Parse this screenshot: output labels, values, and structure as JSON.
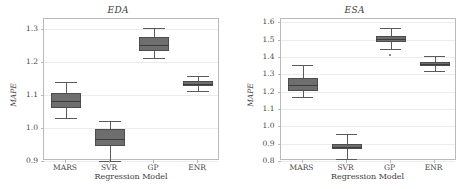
{
  "chart_data": [
    {
      "type": "box",
      "title": "EDA",
      "xlabel": "Regression Model",
      "ylabel": "MAPE",
      "categories": [
        "MARS",
        "SVR",
        "GP",
        "ENR"
      ],
      "ylim": [
        0.9,
        1.33
      ],
      "yticks": [
        0.9,
        1.0,
        1.1,
        1.2,
        1.3
      ],
      "ytick_labels": [
        "0.9",
        "1.0",
        "1.1",
        "1.2",
        "1.3"
      ],
      "grid": true,
      "legend": "none",
      "boxes": [
        {
          "name": "MARS",
          "whisker_low": 1.03,
          "q1": 1.06,
          "median": 1.082,
          "q3": 1.107,
          "whisker_high": 1.14,
          "fliers": []
        },
        {
          "name": "SVR",
          "whisker_low": 0.9,
          "q1": 0.945,
          "median": 0.968,
          "q3": 0.998,
          "whisker_high": 1.022,
          "fliers": []
        },
        {
          "name": "GP",
          "whisker_low": 1.212,
          "q1": 1.234,
          "median": 1.252,
          "q3": 1.276,
          "whisker_high": 1.303,
          "fliers": []
        },
        {
          "name": "ENR",
          "whisker_low": 1.112,
          "q1": 1.128,
          "median": 1.134,
          "q3": 1.141,
          "whisker_high": 1.156,
          "fliers": []
        }
      ]
    },
    {
      "type": "box",
      "title": "ESA",
      "xlabel": "Regression Model",
      "ylabel": "MAPE",
      "categories": [
        "MARS",
        "SVR",
        "GP",
        "ENR"
      ],
      "ylim": [
        0.8,
        1.62
      ],
      "yticks": [
        0.8,
        0.9,
        1.0,
        1.1,
        1.2,
        1.3,
        1.4,
        1.5,
        1.6
      ],
      "ytick_labels": [
        "0.8",
        "0.9",
        "1.0",
        "1.1",
        "1.2",
        "1.3",
        "1.4",
        "1.5",
        "1.6"
      ],
      "grid": true,
      "legend": "none",
      "boxes": [
        {
          "name": "MARS",
          "whisker_low": 1.168,
          "q1": 1.205,
          "median": 1.238,
          "q3": 1.278,
          "whisker_high": 1.352,
          "fliers": []
        },
        {
          "name": "SVR",
          "whisker_low": 0.81,
          "q1": 0.868,
          "median": 0.883,
          "q3": 0.898,
          "whisker_high": 0.958,
          "fliers": []
        },
        {
          "name": "GP",
          "whisker_low": 1.448,
          "q1": 1.487,
          "median": 1.503,
          "q3": 1.519,
          "whisker_high": 1.57,
          "fliers": [
            1.41
          ]
        },
        {
          "name": "ENR",
          "whisker_low": 1.322,
          "q1": 1.347,
          "median": 1.36,
          "q3": 1.373,
          "whisker_high": 1.404,
          "fliers": []
        }
      ]
    }
  ],
  "style": {
    "box_fill": "#6e6e6e",
    "box_edge": "#4d4d4d",
    "median_color": "#3d3d3d",
    "whisker_color": "#5a5a5a",
    "grid_color": "#ececec",
    "axis_color": "#b9b9b9",
    "text_color": "#3b3b3b",
    "background": "#ffffff"
  }
}
